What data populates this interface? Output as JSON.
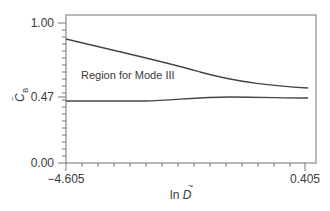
{
  "chart_data": {
    "type": "line",
    "title": "",
    "xlabel": "ln D̃",
    "ylabel": "C̃B",
    "xlim": [
      -4.605,
      0.405
    ],
    "ylim": [
      0.0,
      1.0
    ],
    "x_ticks": [
      "-4.605",
      "0.405"
    ],
    "y_ticks": [
      "0.00",
      "0.47",
      "1.00"
    ],
    "grid": false,
    "legend": null,
    "annotations": [
      {
        "text": "Region for Mode III",
        "x": -4.2,
        "y": 0.6
      }
    ],
    "series": [
      {
        "name": "upper boundary",
        "x": [
          -4.605,
          -3.5,
          -2.5,
          -1.5,
          -0.5,
          0.405
        ],
        "y": [
          0.88,
          0.82,
          0.75,
          0.66,
          0.58,
          0.54
        ]
      },
      {
        "name": "lower boundary",
        "x": [
          -4.605,
          -3.5,
          -2.5,
          -1.5,
          -0.5,
          0.405
        ],
        "y": [
          0.445,
          0.445,
          0.447,
          0.465,
          0.47,
          0.465
        ]
      }
    ]
  },
  "labels": {
    "x_tick_min": "−4.605",
    "x_tick_max": "0.405",
    "y_tick_top": "1.00",
    "y_tick_mid": "0.47",
    "y_tick_bottom": "0.00",
    "xlabel_prefix": "ln ",
    "xlabel_var": "D",
    "ylabel_var": "C",
    "ylabel_sub": "B",
    "annotation": "Region for Mode III"
  }
}
